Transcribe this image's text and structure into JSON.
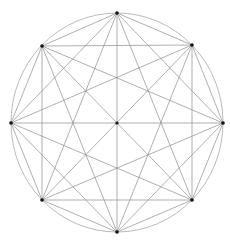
{
  "diagram": {
    "type": "complete-graph-on-circle",
    "canvas": {
      "width": 230,
      "height": 248
    },
    "circle": {
      "cx": 117,
      "cy": 122.5,
      "rx": 106,
      "ry": 109.5
    },
    "vertex_count": 8,
    "vertices": [
      {
        "id": "top",
        "x": 117,
        "y": 13
      },
      {
        "id": "upper-right",
        "x": 192,
        "y": 45
      },
      {
        "id": "right",
        "x": 223,
        "y": 123
      },
      {
        "id": "lower-right",
        "x": 192,
        "y": 200
      },
      {
        "id": "bottom",
        "x": 117,
        "y": 232
      },
      {
        "id": "lower-left",
        "x": 42,
        "y": 200
      },
      {
        "id": "left",
        "x": 11,
        "y": 123
      },
      {
        "id": "upper-left",
        "x": 42,
        "y": 46
      }
    ],
    "center_point": {
      "x": 117,
      "y": 123
    },
    "colors": {
      "background": "#ffffff",
      "circle": "#a8a8a8",
      "lines": "#8c8c8c",
      "points": "#111111"
    }
  }
}
